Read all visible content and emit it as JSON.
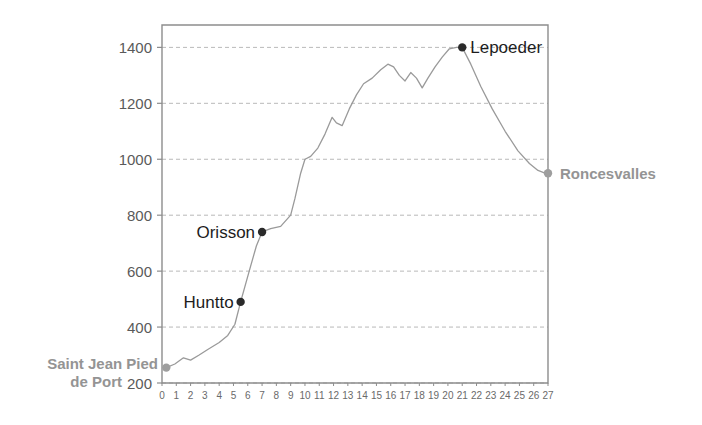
{
  "chart_data": {
    "type": "line",
    "title": "",
    "subtitle": "",
    "xlabel": "",
    "ylabel": "",
    "xlim": [
      0,
      27
    ],
    "ylim": [
      200,
      1480
    ],
    "grid": true,
    "legend_position": "none",
    "x_ticks": [
      0,
      1,
      2,
      3,
      4,
      5,
      6,
      7,
      8,
      9,
      10,
      11,
      12,
      13,
      14,
      15,
      16,
      17,
      18,
      19,
      20,
      21,
      22,
      23,
      24,
      25,
      26,
      27
    ],
    "x_tick_labels": [
      "0",
      "1",
      "2",
      "3",
      "4",
      "5",
      "6",
      "7",
      "8",
      "9",
      "10",
      "11",
      "12",
      "13",
      "14",
      "15",
      "16",
      "17",
      "18",
      "19",
      "20",
      "21",
      "22",
      "23",
      "24",
      "25",
      "26",
      "27"
    ],
    "y_ticks": [
      200,
      400,
      600,
      800,
      1000,
      1200,
      1400
    ],
    "y_tick_labels": [
      "200",
      "400",
      "600",
      "800",
      "1000",
      "1200",
      "1400"
    ],
    "series": [
      {
        "name": "elevation",
        "color": "#9a9a9a",
        "x": [
          0.3,
          0.9,
          1.5,
          2.0,
          2.6,
          3.2,
          4.0,
          4.6,
          5.1,
          5.5,
          6.1,
          6.6,
          7.0,
          7.6,
          8.3,
          9.0,
          9.3,
          9.7,
          10.0,
          10.4,
          10.9,
          11.4,
          11.9,
          12.2,
          12.6,
          13.1,
          13.6,
          14.1,
          14.7,
          15.3,
          15.8,
          16.2,
          16.6,
          17.0,
          17.4,
          17.8,
          18.2,
          18.6,
          19.1,
          19.6,
          20.1,
          20.6,
          21.0,
          21.6,
          22.3,
          23.1,
          24.0,
          24.9,
          25.7,
          26.3,
          26.7,
          27.0
        ],
        "y": [
          255,
          268,
          290,
          282,
          300,
          320,
          345,
          370,
          410,
          490,
          600,
          690,
          740,
          752,
          760,
          800,
          860,
          950,
          1000,
          1010,
          1040,
          1090,
          1150,
          1130,
          1120,
          1180,
          1230,
          1270,
          1290,
          1320,
          1340,
          1330,
          1300,
          1280,
          1310,
          1290,
          1255,
          1290,
          1330,
          1365,
          1395,
          1400,
          1400,
          1340,
          1260,
          1180,
          1100,
          1030,
          985,
          960,
          952,
          950
        ]
      }
    ],
    "markers": [
      {
        "name": "saint-jean-pied-de-port",
        "x": 0.3,
        "y": 255,
        "color": "#9e9e9e",
        "label": "Saint Jean Pied\nde Port",
        "label_line1": "Saint Jean Pied",
        "label_line2": "de Port",
        "label_style": "gray-bold",
        "label_position": "left"
      },
      {
        "name": "huntto",
        "x": 5.5,
        "y": 490,
        "color": "#2a2a2a",
        "label": "Huntto",
        "label_style": "dark",
        "label_position": "left"
      },
      {
        "name": "orisson",
        "x": 7.0,
        "y": 740,
        "color": "#2a2a2a",
        "label": "Orisson",
        "label_style": "dark",
        "label_position": "left"
      },
      {
        "name": "lepoeder",
        "x": 21.0,
        "y": 1400,
        "color": "#2a2a2a",
        "label": "Lepoeder",
        "label_style": "dark",
        "label_position": "right"
      },
      {
        "name": "roncesvalles",
        "x": 27.0,
        "y": 950,
        "color": "#9e9e9e",
        "label": "Roncesvalles",
        "label_style": "gray-bold",
        "label_position": "right"
      }
    ],
    "colors": {
      "line": "#9a9a9a",
      "grid": "#b9b9b9",
      "axis": "#8d8d8d",
      "tick_text": "#5a5a5a",
      "x_tick_text": "#6a6a6a",
      "waypoint_dark": "#2a2a2a",
      "waypoint_gray": "#9e9e9e",
      "label_gray": "#949494",
      "label_dark": "#1d1d1d",
      "background": "#ffffff"
    }
  },
  "labels": {
    "saint_jean_line1": "Saint Jean Pied",
    "saint_jean_line2": "de Port",
    "huntto": "Huntto",
    "orisson": "Orisson",
    "lepoeder": "Lepoeder",
    "roncesvalles": "Roncesvalles"
  },
  "y_axis": {
    "t200": "200",
    "t400": "400",
    "t600": "600",
    "t800": "800",
    "t1000": "1000",
    "t1200": "1200",
    "t1400": "1400"
  }
}
